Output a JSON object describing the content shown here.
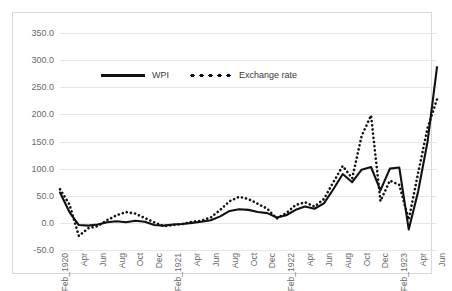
{
  "chart_data": {
    "type": "line",
    "title": "",
    "xlabel": "",
    "ylabel": "",
    "ylim": [
      -50,
      350
    ],
    "yticks": [
      "-50.0",
      "0.0",
      "50.0",
      "100.0",
      "150.0",
      "200.0",
      "250.0",
      "300.0",
      "350.0"
    ],
    "grid": true,
    "legend_position": "top-center",
    "x": [
      "Feb_1920",
      "Mar_1920",
      "Apr_1920",
      "May_1920",
      "Jun_1920",
      "Jul_1920",
      "Aug_1920",
      "Sep_1920",
      "Oct_1920",
      "Nov_1920",
      "Dec_1920",
      "Jan_1921",
      "Feb_1921",
      "Mar_1921",
      "Apr_1921",
      "May_1921",
      "Jun_1921",
      "Jul_1921",
      "Aug_1921",
      "Sep_1921",
      "Oct_1921",
      "Nov_1921",
      "Dec_1921",
      "Jan_1922",
      "Feb_1922",
      "Mar_1922",
      "Apr_1922",
      "May_1922",
      "Jun_1922",
      "Jul_1922",
      "Aug_1922",
      "Sep_1922",
      "Oct_1922",
      "Nov_1922",
      "Dec_1922",
      "Jan_1923",
      "Feb_1923",
      "Mar_1923",
      "Apr_1923",
      "May_1923",
      "Jun_1923"
    ],
    "xticks": [
      "Feb_1920",
      "",
      "Apr",
      "",
      "Jun",
      "",
      "Aug",
      "",
      "Oct",
      "",
      "Dec",
      "",
      "Feb_1921",
      "",
      "Apr",
      "",
      "Jun",
      "",
      "Aug",
      "",
      "Oct",
      "",
      "Dec",
      "",
      "Feb_1922",
      "",
      "Apr",
      "",
      "Jun",
      "",
      "Aug",
      "",
      "Oct",
      "",
      "Dec",
      "",
      "Feb_1923",
      "",
      "Apr",
      "",
      "Jun"
    ],
    "series": [
      {
        "name": "WPI",
        "style": "solid",
        "color": "#111111",
        "values": [
          56,
          22,
          -2,
          -3,
          -2,
          1,
          2,
          0,
          3,
          1,
          -3,
          -4,
          -2,
          -1,
          0,
          1,
          3,
          8,
          13,
          16,
          15,
          14,
          15,
          8,
          10,
          18,
          22,
          20,
          26,
          48,
          60,
          72,
          82,
          90,
          88,
          92,
          76,
          82,
          79,
          66,
          74
        ],
        "values_detail": [
          56,
          22,
          -2,
          -3,
          -2,
          1,
          2,
          0,
          3,
          1,
          -3,
          -4,
          -2,
          -1,
          0,
          1,
          3,
          8,
          13,
          16,
          15,
          14,
          15,
          8,
          10,
          18,
          22,
          20,
          26,
          48,
          60,
          72,
          82,
          90,
          88,
          92,
          76,
          82,
          79,
          66,
          74
        ]
      },
      {
        "name": "Exchange rate",
        "style": "dotted",
        "color": "#111111",
        "values": [
          62,
          30,
          -20,
          -8,
          -5,
          4,
          10,
          14,
          12,
          6,
          0,
          -5,
          -3,
          -1,
          1,
          3,
          8,
          18,
          30,
          36,
          34,
          28,
          22,
          6,
          14,
          26,
          30,
          24,
          34,
          58,
          70,
          96,
          130,
          170,
          200,
          120,
          50,
          60,
          86,
          110,
          230
        ]
      }
    ],
    "series_wpi_plotted": [
      56,
      20,
      -4,
      -5,
      -3,
      1,
      3,
      1,
      4,
      2,
      -4,
      -5,
      -3,
      -2,
      0,
      2,
      5,
      12,
      22,
      25,
      24,
      20,
      18,
      10,
      14,
      24,
      30,
      26,
      36,
      62,
      90,
      75,
      98,
      103,
      60,
      100,
      102,
      -12,
      58,
      150,
      287
    ],
    "series_er_plotted": [
      62,
      34,
      -24,
      -10,
      -6,
      5,
      14,
      20,
      17,
      9,
      1,
      -6,
      -4,
      -2,
      2,
      4,
      10,
      24,
      40,
      48,
      44,
      35,
      26,
      8,
      18,
      33,
      38,
      30,
      44,
      75,
      105,
      82,
      160,
      198,
      40,
      78,
      70,
      6,
      92,
      175,
      228
    ]
  },
  "legend": {
    "items": [
      {
        "label": "WPI",
        "style": "solid"
      },
      {
        "label": "Exchange rate",
        "style": "dotted"
      }
    ]
  }
}
